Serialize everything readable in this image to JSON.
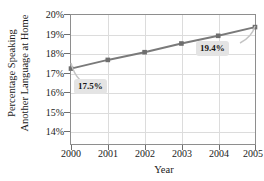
{
  "chart_data": {
    "type": "line",
    "title": "",
    "xlabel": "Year",
    "ylabel": "Percentage Speaking Another Language at Home",
    "ylabel_line1": "Percentage Speaking",
    "ylabel_line2": "Another Language at Home",
    "categories": [
      "2000",
      "2001",
      "2002",
      "2003",
      "2004",
      "2005"
    ],
    "x": [
      2000,
      2001,
      2002,
      2003,
      2004,
      2005
    ],
    "values": [
      17.5,
      17.9,
      18.25,
      18.65,
      19.0,
      19.4
    ],
    "ylim": [
      14,
      20
    ],
    "xlim": [
      2000,
      2005
    ],
    "ytick_labels": [
      "14%",
      "15%",
      "16%",
      "17%",
      "18%",
      "19%",
      "20%"
    ],
    "ytick_values": [
      14,
      15,
      16,
      17,
      18,
      19,
      20
    ],
    "xtick_labels": [
      "2000",
      "2001",
      "2002",
      "2003",
      "2004",
      "2005"
    ],
    "grid": true,
    "legend": "none",
    "series_color": "#7a7a7a",
    "grid_color": "#dcdcdc",
    "frame_color": "#8e8e8e",
    "annotations": [
      {
        "label": "17.5%",
        "x": 2000,
        "y": 17.5
      },
      {
        "label": "19.4%",
        "x": 2005,
        "y": 19.4
      }
    ]
  },
  "callouts": {
    "first": "17.5%",
    "last": "19.4%"
  },
  "axes": {
    "x_title": "Year",
    "y_title_line1": "Percentage Speaking",
    "y_title_line2": "Another Language at Home"
  },
  "yticks": {
    "t0": "14%",
    "t1": "15%",
    "t2": "16%",
    "t3": "17%",
    "t4": "18%",
    "t5": "19%",
    "t6": "20%"
  },
  "xticks": {
    "t0": "2000",
    "t1": "2001",
    "t2": "2002",
    "t3": "2003",
    "t4": "2004",
    "t5": "2005"
  }
}
